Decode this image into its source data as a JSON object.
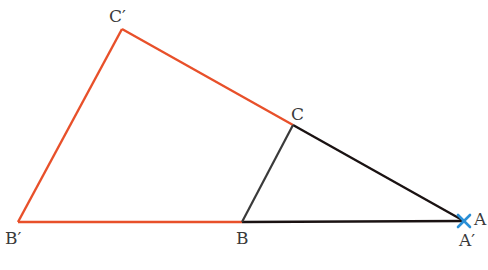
{
  "diagram": {
    "type": "geometry-homothety",
    "colors": {
      "image_triangle": "#e8502a",
      "original_triangle": "#1a1212",
      "side_BC": "#3a3a3a",
      "center_mark": "#2a8fd6",
      "label": "#3a3a3a"
    },
    "points": {
      "A": {
        "label": "A",
        "x": 464,
        "y": 221
      },
      "B": {
        "label": "B",
        "x": 242,
        "y": 222
      },
      "C": {
        "label": "C",
        "x": 293,
        "y": 125
      },
      "Bp": {
        "label": "B′",
        "x": 18,
        "y": 222
      },
      "Cp": {
        "label": "C′",
        "x": 122,
        "y": 29
      }
    },
    "labels": {
      "A": "A",
      "A_prime": "A′",
      "B": "B",
      "B_prime": "B′",
      "C": "C",
      "C_prime": "C′"
    }
  }
}
